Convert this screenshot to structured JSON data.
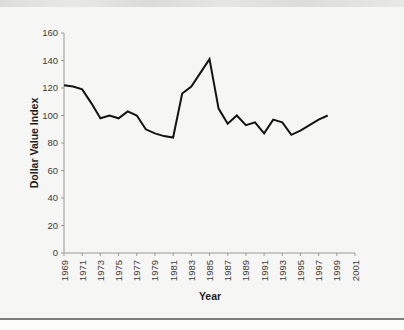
{
  "page": {
    "background": "#f6f6f4",
    "top_band_color": "#dcdcd8",
    "bottom_rule_color": "#7d7d7d"
  },
  "chart_data": {
    "type": "line",
    "title": "",
    "xlabel": "Year",
    "ylabel": "Dollar Value Index",
    "x": [
      1969,
      1970,
      1971,
      1972,
      1973,
      1974,
      1975,
      1976,
      1977,
      1978,
      1979,
      1980,
      1981,
      1982,
      1983,
      1984,
      1985,
      1986,
      1987,
      1988,
      1989,
      1990,
      1991,
      1992,
      1993,
      1994,
      1995,
      1996,
      1997,
      1998
    ],
    "values": [
      122,
      121,
      119,
      109,
      98,
      100,
      98,
      103,
      100,
      90,
      87,
      85,
      84,
      116,
      121,
      131,
      141,
      105,
      94,
      100,
      93,
      95,
      87,
      97,
      95,
      86,
      89,
      93,
      97,
      100
    ],
    "x_axis": {
      "min": 1969,
      "max": 2001,
      "tick_step": 2,
      "tick_labels": [
        "1969",
        "1971",
        "1973",
        "1975",
        "1977",
        "1979",
        "1981",
        "1983",
        "1985",
        "1987",
        "1989",
        "1991",
        "1993",
        "1995",
        "1997",
        "1999",
        "2001"
      ]
    },
    "y_axis": {
      "min": 0,
      "max": 160,
      "tick_step": 20,
      "tick_labels": [
        "0",
        "20",
        "40",
        "60",
        "80",
        "100",
        "120",
        "140",
        "160"
      ]
    },
    "grid": false,
    "legend": "none",
    "line_color": "#141414",
    "axis_color": "#9a9a9a",
    "tick_label_color": "#3c3c3c",
    "axis_title_color": "#1f1f1f"
  }
}
